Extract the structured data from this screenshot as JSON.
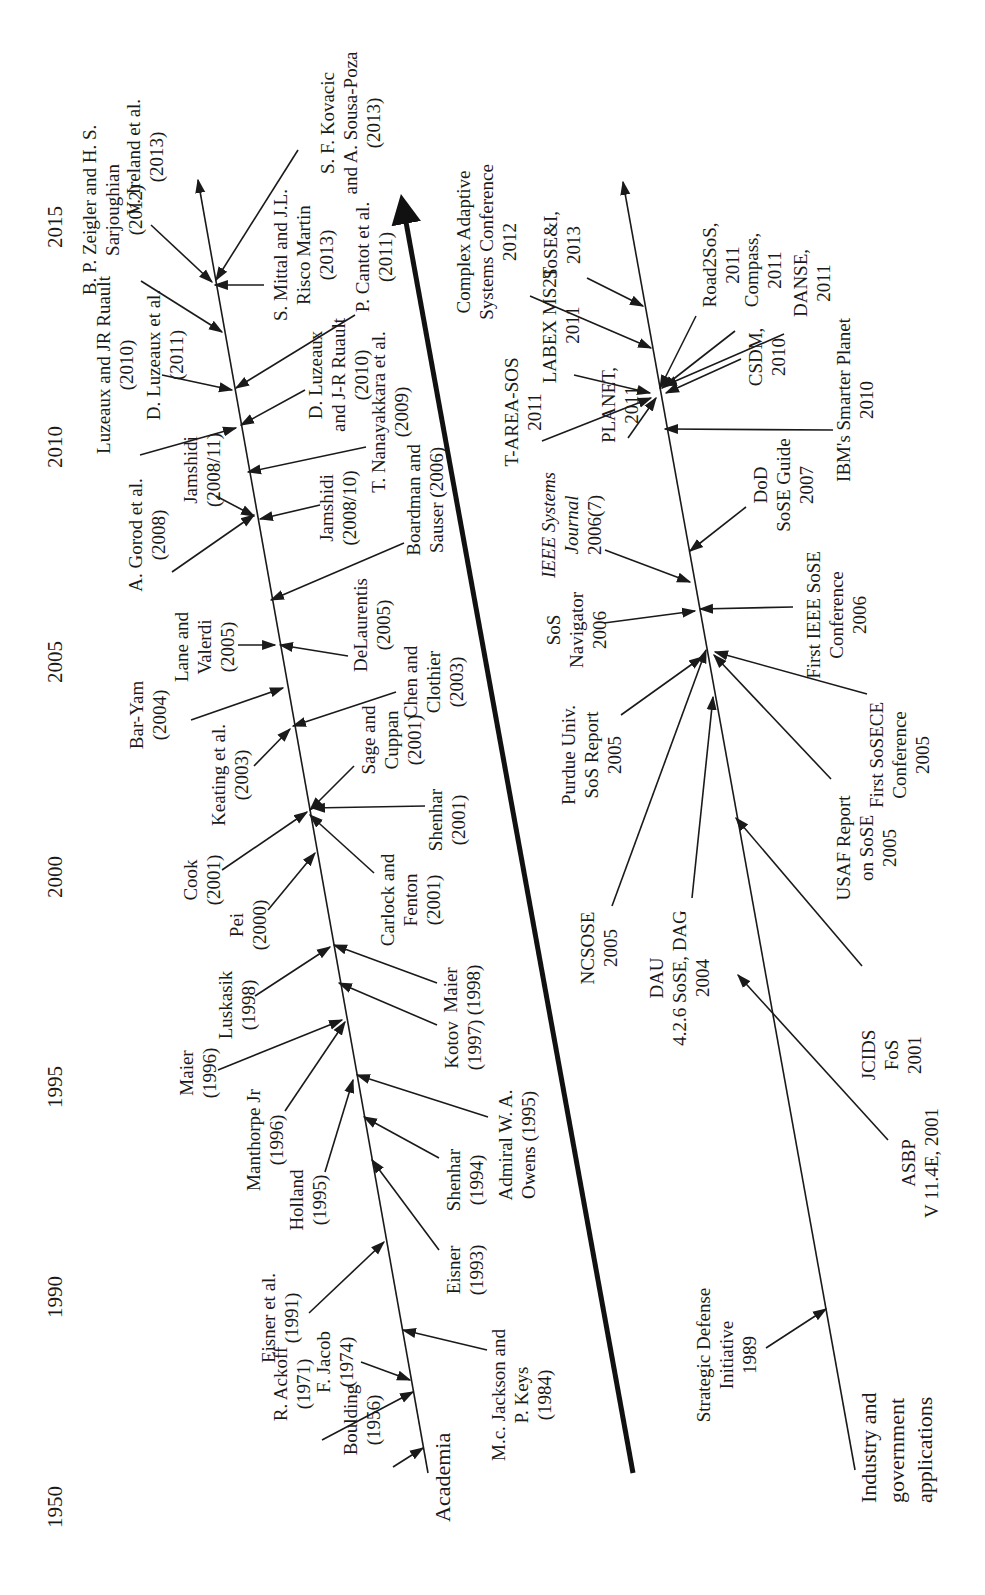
{
  "figure": {
    "orientation": "rotated -90deg (timeline runs bottom to top)",
    "axis_years": [
      {
        "label": "1950",
        "y": 1500
      },
      {
        "label": "1990",
        "y": 1290
      },
      {
        "label": "1995",
        "y": 1080
      },
      {
        "label": "2000",
        "y": 870
      },
      {
        "label": "2005",
        "y": 655
      },
      {
        "label": "2010",
        "y": 440
      },
      {
        "label": "2015",
        "y": 220
      }
    ],
    "branches": {
      "academia": {
        "label": "Academia"
      },
      "industry": {
        "label_lines": [
          "Industry and",
          "government",
          "applications"
        ]
      }
    },
    "academia_items": [
      {
        "lines": [
          "Boulding",
          "(1956)"
        ]
      },
      {
        "lines": [
          "R. Ackoff",
          "(1971)"
        ]
      },
      {
        "lines": [
          "F. Jacob",
          "(1974)"
        ]
      },
      {
        "lines": [
          "Eisner et al.",
          "(1991)"
        ]
      },
      {
        "lines": [
          "M.c. Jackson and",
          "P. Keys",
          "(1984)"
        ]
      },
      {
        "lines": [
          "Eisner",
          "(1993)"
        ]
      },
      {
        "lines": [
          "Shenhar",
          "(1994)"
        ]
      },
      {
        "lines": [
          "Admiral W. A.",
          "Owens (1995)"
        ]
      },
      {
        "lines": [
          "Holland",
          "(1995)"
        ]
      },
      {
        "lines": [
          "Manthorpe Jr",
          "(1996)"
        ]
      },
      {
        "lines": [
          "Maier",
          "(1996)"
        ]
      },
      {
        "lines": [
          "Kotov",
          "(1997)"
        ]
      },
      {
        "lines": [
          "Luskasik",
          "(1998)"
        ]
      },
      {
        "lines": [
          "Maier",
          "(1998)"
        ]
      },
      {
        "lines": [
          "Pei",
          "(2000)"
        ]
      },
      {
        "lines": [
          "Cook",
          "(2001)"
        ]
      },
      {
        "lines": [
          "Carlock and",
          "Fenton",
          "(2001)"
        ]
      },
      {
        "lines": [
          "Shenhar",
          "(2001)"
        ]
      },
      {
        "lines": [
          "Sage and",
          "Cuppan",
          "(2001)"
        ]
      },
      {
        "lines": [
          "Keating et al.",
          "(2003)"
        ]
      },
      {
        "lines": [
          "Chen and",
          "Clothier",
          "(2003)"
        ]
      },
      {
        "lines": [
          "Bar-Yam",
          "(2004)"
        ]
      },
      {
        "lines": [
          "Lane and",
          "Valerdi",
          "(2005)"
        ]
      },
      {
        "lines": [
          "DeLaurentis",
          "(2005)"
        ]
      },
      {
        "lines": [
          "Boardman and",
          "Sauser (2006)"
        ]
      },
      {
        "lines": [
          "A. Gorod et al.",
          "(2008)"
        ]
      },
      {
        "lines": [
          "Jamshidi",
          "(2008/11)"
        ]
      },
      {
        "lines": [
          "Jamshidi",
          "(2008/10)"
        ]
      },
      {
        "lines": [
          "T. Nanayakkara et al.",
          "(2009)"
        ]
      },
      {
        "lines": [
          "Luzeaux and JR Ruault",
          "(2010)"
        ]
      },
      {
        "lines": [
          "D. Luzeaux",
          "and J-R Ruault",
          "(2010)"
        ]
      },
      {
        "lines": [
          "D. Luzeaux et al.",
          "(2011)"
        ]
      },
      {
        "lines": [
          "P. Cantot et al.",
          "(2011)"
        ]
      },
      {
        "lines": [
          "B. P. Zeigler and H. S.",
          "Sarjoughian",
          "(2012)"
        ]
      },
      {
        "lines": [
          "S. Mittal and J.L.",
          "Risco Martin",
          "(2013)"
        ]
      },
      {
        "lines": [
          "V. Ireland et al.",
          "(2013)"
        ]
      },
      {
        "lines": [
          "S. F. Kovacic",
          "and A. Sousa-Poza",
          "(2013)"
        ]
      }
    ],
    "industry_items": [
      {
        "lines": [
          "Strategic Defense",
          "Initiative",
          "1989"
        ]
      },
      {
        "lines": [
          "ASBP",
          "V 11.4E, 2001"
        ]
      },
      {
        "lines": [
          "JCIDS",
          "FoS",
          "2001"
        ]
      },
      {
        "lines": [
          "DAU",
          "4.2.6 SoSE, DAG",
          "2004"
        ]
      },
      {
        "lines": [
          "NCSOSE",
          "2005"
        ]
      },
      {
        "lines": [
          "USAF Report",
          "on SoSE",
          "2005"
        ]
      },
      {
        "lines": [
          "Purdue Univ.",
          "SoS Report",
          "2005"
        ]
      },
      {
        "lines": [
          "First SoSECE",
          "Conference",
          "2005"
        ]
      },
      {
        "lines": [
          "SoS",
          "Navigator",
          "2006"
        ]
      },
      {
        "lines": [
          "First IEEE SoSE",
          "Conference",
          "2006"
        ]
      },
      {
        "lines": [
          "IEEE Systems",
          "Journal",
          "2006(7)"
        ]
      },
      {
        "lines": [
          "DoD",
          "SoSE Guide",
          "2007"
        ]
      },
      {
        "lines": [
          "IBM's Smarter Planet",
          "2010"
        ]
      },
      {
        "lines": [
          "CSDM,",
          "2010"
        ]
      },
      {
        "lines": [
          "PLANET,",
          "2011"
        ]
      },
      {
        "lines": [
          "T-AREA-SOS",
          "2011"
        ]
      },
      {
        "lines": [
          "LABEX MS2T",
          "2011"
        ]
      },
      {
        "lines": [
          "DANSE,",
          "2011"
        ]
      },
      {
        "lines": [
          "Compass,",
          "2011"
        ]
      },
      {
        "lines": [
          "Road2SoS,",
          "2011"
        ]
      },
      {
        "lines": [
          "Complex Adaptive",
          "Systems Conference",
          "2012"
        ]
      },
      {
        "lines": [
          "SoSE&I,",
          "2013"
        ]
      }
    ]
  }
}
